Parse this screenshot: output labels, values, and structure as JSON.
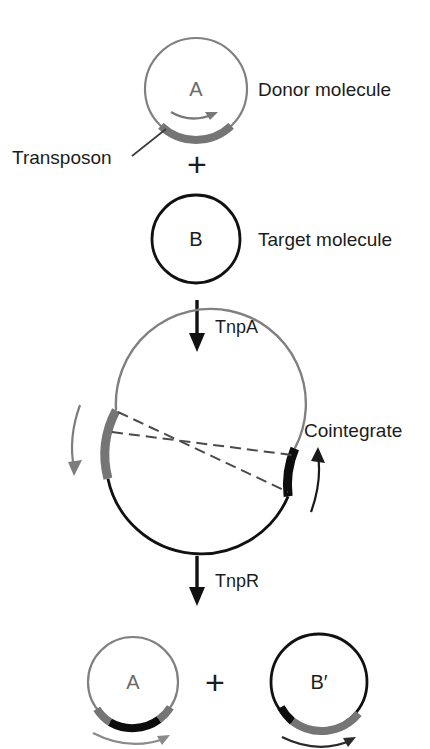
{
  "figure": {
    "background": "#ffffff",
    "colors": {
      "donor_gray": "#808080",
      "target_black": "#111111",
      "text": "#1c1c1c",
      "transposon_gray": "#757575",
      "transposon_black": "#0d0d0d"
    }
  },
  "stage_donor": {
    "circle_letter": "A",
    "label": "Donor molecule",
    "transposon_label": "Transposon",
    "transposon_color": "#757575",
    "circle_color": "#808080"
  },
  "operator_plus_top": "+",
  "stage_target": {
    "circle_letter": "B",
    "label": "Target molecule",
    "circle_color": "#111111"
  },
  "step_one": {
    "enzyme": "TnpA",
    "arrow": "down-arrow-icon"
  },
  "stage_cointegrate": {
    "label": "Cointegrate",
    "donor_arc_color": "#808080",
    "target_arc_color": "#111111",
    "transposon_copy_1_color": "#757575",
    "transposon_copy_2_color": "#0d0d0d",
    "crossover_lines": 2,
    "rotation_arrow_left": "counterclockwise-arrow-icon",
    "rotation_arrow_right": "clockwise-arrow-icon"
  },
  "step_two": {
    "enzyme": "TnpR",
    "arrow": "down-arrow-icon"
  },
  "stage_products": {
    "left_circle_letter": "A",
    "right_circle_letter": "B′",
    "operator_plus": "+",
    "left_circle_color": "#808080",
    "right_circle_color": "#111111"
  }
}
